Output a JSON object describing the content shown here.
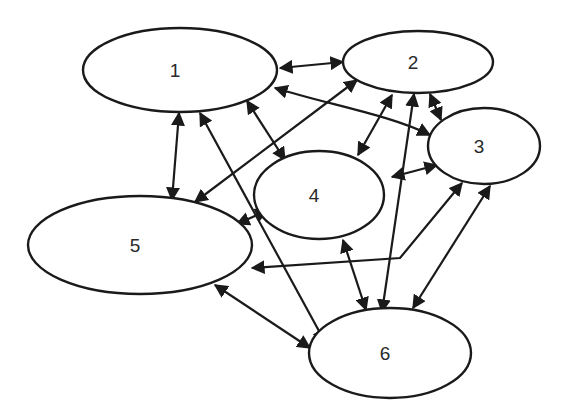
{
  "diagram": {
    "type": "network-graph",
    "directed": "bidirectional",
    "colors": {
      "stroke": "#1a1a1a",
      "fill": "#ffffff",
      "label": "#2a2a2a"
    },
    "nodes": [
      {
        "id": "1",
        "label": "1",
        "cx": 180,
        "cy": 70,
        "rx": 97,
        "ry": 42
      },
      {
        "id": "2",
        "label": "2",
        "cx": 418,
        "cy": 62,
        "rx": 75,
        "ry": 31
      },
      {
        "id": "3",
        "label": "3",
        "cx": 484,
        "cy": 146,
        "rx": 56,
        "ry": 38
      },
      {
        "id": "4",
        "label": "4",
        "cx": 319,
        "cy": 195,
        "rx": 65,
        "ry": 44
      },
      {
        "id": "5",
        "label": "5",
        "cx": 140,
        "cy": 245,
        "rx": 112,
        "ry": 49
      },
      {
        "id": "6",
        "label": "6",
        "cx": 390,
        "cy": 353,
        "rx": 81,
        "ry": 45
      }
    ],
    "edges": [
      {
        "from": "1",
        "to": "2",
        "path": "M280,68 L343,62"
      },
      {
        "from": "1",
        "to": "3",
        "path": "M275,88 C330,105 390,115 430,135"
      },
      {
        "from": "1",
        "to": "4",
        "path": "M247,101 L285,160"
      },
      {
        "from": "1",
        "to": "5",
        "path": "M179,113 L172,200"
      },
      {
        "from": "1",
        "to": "6",
        "path": "M200,113 L325,342"
      },
      {
        "from": "2",
        "to": "5",
        "path": "M357,80 L195,202"
      },
      {
        "from": "2",
        "to": "4",
        "path": "M392,95 L358,155"
      },
      {
        "from": "2",
        "to": "3",
        "path": "M430,94 L441,120"
      },
      {
        "from": "2",
        "to": "6",
        "path": "M414,94 L382,312"
      },
      {
        "from": "3",
        "to": "4",
        "path": "M437,165 L392,177"
      },
      {
        "from": "3",
        "to": "5",
        "path": "M462,183 L400,258 L252,268"
      },
      {
        "from": "3",
        "to": "6",
        "path": "M490,186 L413,308"
      },
      {
        "from": "4",
        "to": "5",
        "path": "M268,210 L237,224"
      },
      {
        "from": "4",
        "to": "6",
        "path": "M343,240 L366,310"
      },
      {
        "from": "5",
        "to": "6",
        "path": "M215,285 L310,348"
      }
    ]
  }
}
